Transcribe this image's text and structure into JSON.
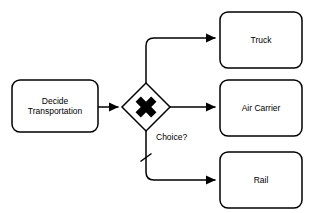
{
  "diagram": {
    "type": "bpmn-flowchart",
    "background_color": "#ffffff",
    "stroke_color": "#000000",
    "fill_color": "#ffffff",
    "width": 316,
    "height": 213,
    "nodes": [
      {
        "id": "decide",
        "shape": "rounded-rectangle",
        "label": "Decide\nTransportation",
        "x": 12,
        "y": 80,
        "width": 86,
        "height": 52
      },
      {
        "id": "gateway",
        "shape": "exclusive-gateway-diamond",
        "label": "",
        "marker": "x-cross",
        "center_x": 146,
        "center_y": 107,
        "half_size": 24
      },
      {
        "id": "truck",
        "shape": "rounded-rectangle",
        "label": "Truck",
        "x": 220,
        "y": 12,
        "width": 82,
        "height": 56
      },
      {
        "id": "air_carrier",
        "shape": "rounded-rectangle",
        "label": "Air Carrier",
        "x": 220,
        "y": 80,
        "width": 82,
        "height": 56
      },
      {
        "id": "rail",
        "shape": "rounded-rectangle",
        "label": "Rail",
        "x": 220,
        "y": 152,
        "width": 82,
        "height": 56
      }
    ],
    "edges": [
      {
        "id": "edge-decide-gateway",
        "from": "decide",
        "to": "gateway",
        "label": "",
        "arrowhead": "filled-triangle",
        "default_flow": false
      },
      {
        "id": "edge-gateway-truck",
        "from": "gateway",
        "to": "truck",
        "label": "",
        "arrowhead": "filled-triangle",
        "default_flow": false
      },
      {
        "id": "edge-gateway-air-carrier",
        "from": "gateway",
        "to": "air_carrier",
        "label": "",
        "arrowhead": "filled-triangle",
        "default_flow": false
      },
      {
        "id": "edge-gateway-rail",
        "from": "gateway",
        "to": "rail",
        "label": "",
        "arrowhead": "filled-triangle",
        "default_flow": true
      }
    ],
    "gateway_label": "Choice?"
  }
}
